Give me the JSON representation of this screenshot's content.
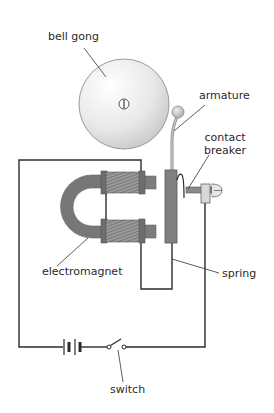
{
  "diagram": {
    "type": "electric bell circuit",
    "labels": {
      "bell_gong": "bell gong",
      "armature": "armature",
      "contact_breaker": "contact\nbreaker",
      "electromagnet": "electromagnet",
      "spring": "spring",
      "switch": "switch"
    },
    "components": [
      "bell gong",
      "armature",
      "contact breaker",
      "electromagnet",
      "spring",
      "battery",
      "switch"
    ],
    "colors": {
      "wire": "#2b2b2b",
      "gong_fill": "#e6e6e6",
      "core": "#777777",
      "coil": "#8a8a8a",
      "armature_bar": "#808080",
      "ball": "#cfcfcf"
    }
  }
}
